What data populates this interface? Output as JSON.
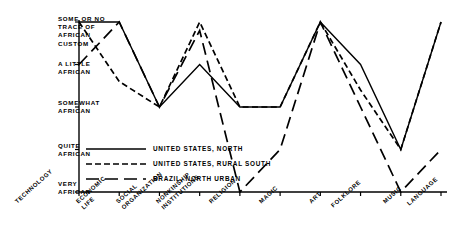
{
  "chart_data": {
    "type": "line",
    "title": "",
    "xlabel": "",
    "ylabel": "",
    "grid": false,
    "legend_position": "inside-lower-left",
    "categories": [
      "TECHNOLOGY",
      "ECONOMIC\nLIFE",
      "SOCIAL\nORGANIZATION",
      "NONKINSHIP\nINSTITUTIONS",
      "RELIGION",
      "MAGIC",
      "ART",
      "FOLKLORE",
      "MUSIC",
      "LANGUAGE"
    ],
    "y_tick_labels": [
      "VERY\nAFRICAN",
      "QUITE\nAFRICAN",
      "SOMEWHAT\nAFRICAN",
      "A LITTLE\nAFRICAN",
      "SOME OR NO\nTRACE OF\nAFRICAN\nCUSTOM"
    ],
    "y_tick_values": [
      0,
      1,
      2,
      3,
      4
    ],
    "ylim": [
      0,
      4
    ],
    "series": [
      {
        "name": "UNITED STATES, NORTH",
        "style": "solid",
        "color": "#000000",
        "values": [
          4,
          4,
          2,
          3,
          2,
          2,
          4,
          3,
          1,
          4
        ]
      },
      {
        "name": "UNITED STATES, RURAL SOUTH",
        "style": "short-dash",
        "color": "#000000",
        "values": [
          4,
          2.6,
          2,
          4,
          2,
          2,
          4,
          2.4,
          1,
          4
        ]
      },
      {
        "name": "BRAZIL, NORTH URBAN",
        "style": "long-dash",
        "color": "#000000",
        "values": [
          3,
          4,
          2,
          3.8,
          0,
          1,
          4,
          2,
          0,
          1
        ]
      }
    ]
  },
  "legend": {
    "items": [
      {
        "label": "UNITED STATES, NORTH",
        "style": "solid"
      },
      {
        "label": "UNITED STATES, RURAL SOUTH",
        "style": "short-dash"
      },
      {
        "label": "BRAZIL, NORTH URBAN",
        "style": "long-dash"
      }
    ]
  }
}
